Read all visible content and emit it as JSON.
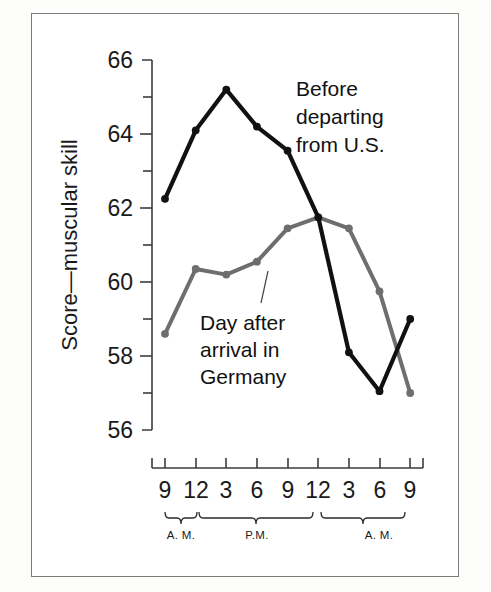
{
  "chart_data": {
    "type": "line",
    "title": "",
    "xlabel": "",
    "ylabel": "Score—muscular skill",
    "ylim": [
      55,
      66.6
    ],
    "yticks_major": [
      56,
      58,
      60,
      62,
      64,
      66
    ],
    "yticks_minor": [
      57,
      59,
      61,
      63,
      65
    ],
    "grid": false,
    "legend_position": "inline-annotation",
    "categories": [
      "9",
      "12",
      "3",
      "6",
      "9",
      "12",
      "3",
      "6",
      "9"
    ],
    "x_tick_labels": [
      "9",
      "12",
      "3",
      "6",
      "9",
      "12",
      "3",
      "6",
      "9"
    ],
    "period_brackets": [
      {
        "label": "A. M.",
        "from_index": 0,
        "to_index": 1
      },
      {
        "label": "P.M.",
        "from_index": 1,
        "to_index": 5
      },
      {
        "label": "A. M.",
        "from_index": 5,
        "to_index": 8
      }
    ],
    "series": [
      {
        "name": "Before departing from U.S.",
        "color": "#111111",
        "values": [
          62.25,
          64.1,
          65.2,
          64.2,
          63.55,
          61.75,
          58.1,
          57.05,
          59.0
        ]
      },
      {
        "name": "Day after arrival in Germany",
        "color": "#6e6e6e",
        "values": [
          58.6,
          60.35,
          60.2,
          60.55,
          61.45,
          61.75,
          61.45,
          59.75,
          57.0
        ]
      }
    ],
    "annotations": [
      {
        "name": "before-departing-label",
        "lines": [
          "Before",
          "departing",
          "from U.S."
        ],
        "x": 296,
        "y": 96
      },
      {
        "name": "day-after-arrival-label",
        "lines": [
          "Day after",
          "arrival in",
          "Germany"
        ],
        "x": 200,
        "y": 330
      }
    ]
  },
  "axis": {
    "y_label": "Score—muscular skill",
    "y_tick_labels": [
      "66",
      "64",
      "62",
      "60",
      "58",
      "56"
    ],
    "x_tick_labels": [
      "9",
      "12",
      "3",
      "6",
      "9",
      "12",
      "3",
      "6",
      "9"
    ],
    "period_labels": [
      "A. M.",
      "P.M.",
      "A. M."
    ]
  },
  "colors": {
    "series_before": "#111111",
    "series_after": "#6e6e6e",
    "axis": "#3d3d3d",
    "border": "#7a7a78",
    "background": "#ffffff",
    "page": "#fdfdfb"
  }
}
